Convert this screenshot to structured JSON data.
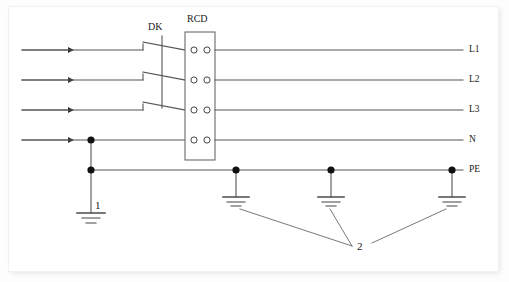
{
  "diagram": {
    "type": "electrical-schematic",
    "devices": [
      {
        "id": "dk",
        "label": "DK",
        "description": "three-pole ganged isolator switch"
      },
      {
        "id": "rcd",
        "label": "RCD",
        "description": "residual current device with four terminal pairs"
      }
    ],
    "rails": [
      {
        "id": "l1",
        "label": "L1",
        "y": 50
      },
      {
        "id": "l2",
        "label": "L2",
        "y": 80
      },
      {
        "id": "l3",
        "label": "L3",
        "y": 110
      },
      {
        "id": "n",
        "label": "N",
        "y": 140
      },
      {
        "id": "pe",
        "label": "PE",
        "y": 170
      }
    ],
    "callouts": [
      {
        "id": "callout-1",
        "label": "1",
        "description": "main earth electrode on neutral / PE bond"
      },
      {
        "id": "callout-2",
        "label": "2",
        "description": "supplementary earth electrodes on PE conductor"
      }
    ],
    "colors": {
      "line": "#555555",
      "node": "#111111",
      "box_stroke": "#6b6b6b",
      "text": "#1a1a1a",
      "paper": "#ffffff"
    }
  }
}
